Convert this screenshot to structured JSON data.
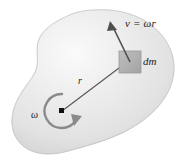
{
  "figure": {
    "background_color": "#ffffff",
    "body_fill_light": "#f2f2f2",
    "body_fill_mid": "#e2e2e2",
    "body_fill_dark": "#cfcfcf",
    "body_edge_color": "#bdbdbd",
    "ink_color": "#4a4a4a",
    "label_color": "#232323",
    "dm_square_color": "#b3b3b3",
    "dm_square_edge": "#8f8f8f"
  },
  "labels": {
    "velocity": "v = ωr",
    "mass_element": "dm",
    "radius": "r",
    "angular_velocity": "ω"
  },
  "icons": {
    "body": "irregular-blob-shape",
    "velocity_arrow": "velocity-vector-arrow",
    "radius_line": "radius-line",
    "rotation_arrow": "circular-rotation-arrow",
    "pivot": "rotation-axis-point",
    "mass_element": "mass-element-square"
  },
  "geometry": {
    "pivot_point": {
      "x": 62,
      "y": 111
    },
    "mass_element_center": {
      "x": 130,
      "y": 62
    },
    "velocity_arrow_tip": {
      "x": 110,
      "y": 23
    },
    "rotation_sense": "counterclockwise-drawn-clockwise-arrowhead"
  }
}
